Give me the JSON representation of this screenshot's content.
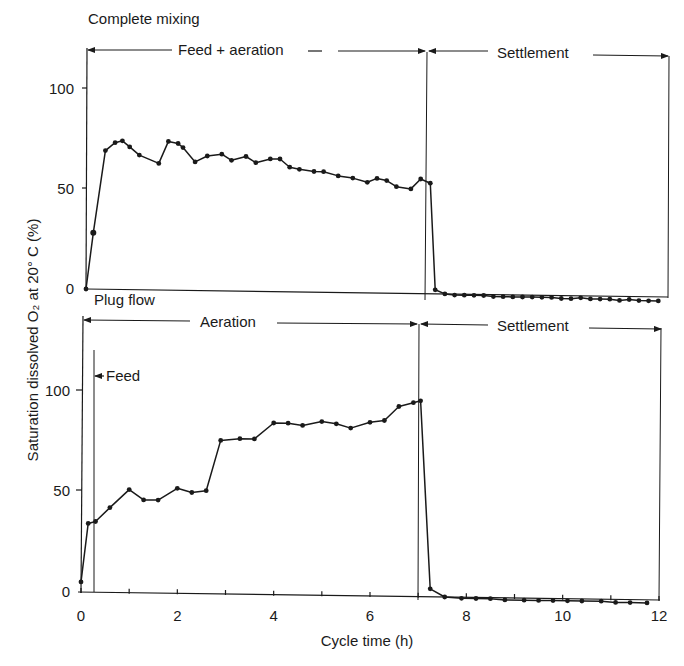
{
  "figure": {
    "y_axis_title": "Saturation dissolved O₂ at 20° C (%)",
    "x_axis_title": "Cycle time (h)",
    "x_ticks": [
      "0",
      "2",
      "4",
      "6",
      "8",
      "10",
      "12"
    ],
    "y_ticks": [
      "0",
      "50",
      "100"
    ]
  },
  "panels": [
    {
      "title": "Complete mixing",
      "phase_labels": [
        {
          "label": "Feed + aeration",
          "start_h": 0,
          "end_h": 7.1
        },
        {
          "label": "Settlement",
          "start_h": 7.1,
          "end_h": 12
        }
      ],
      "feed_marker": null
    },
    {
      "title": "Plug flow",
      "phase_labels": [
        {
          "label": "Aeration",
          "start_h": 0,
          "end_h": 7.0
        },
        {
          "label": "Settlement",
          "start_h": 7.0,
          "end_h": 12
        }
      ],
      "feed_marker": {
        "label": "Feed",
        "at_h": 0.25
      }
    }
  ],
  "chart_data": [
    {
      "type": "line",
      "title": "Complete mixing",
      "xlabel": "Cycle time (h)",
      "ylabel": "Saturation dissolved O2 at 20° C (%)",
      "xlim": [
        0,
        12
      ],
      "ylim": [
        0,
        100
      ],
      "grid": false,
      "annotations": [
        "Feed + aeration (0–7.1 h)",
        "Settlement (7.1–12 h)"
      ],
      "series": [
        {
          "name": "Complete mixing",
          "x": [
            0,
            0.15,
            0.4,
            0.6,
            0.75,
            0.9,
            1.1,
            1.5,
            1.7,
            1.9,
            2.0,
            2.25,
            2.5,
            2.8,
            3.0,
            3.3,
            3.5,
            3.8,
            4.0,
            4.2,
            4.4,
            4.7,
            4.9,
            5.2,
            5.5,
            5.8,
            6.0,
            6.2,
            6.4,
            6.7,
            6.9,
            7.1,
            7.2,
            7.4,
            7.6,
            7.8,
            8.0,
            8.2,
            8.4,
            8.6,
            8.8,
            9.0,
            9.2,
            9.4,
            9.6,
            9.8,
            10.0,
            10.2,
            10.4,
            10.6,
            10.8,
            11.0,
            11.2,
            11.4,
            11.6,
            11.8
          ],
          "values": [
            0,
            28,
            69,
            73,
            74,
            71,
            67,
            63,
            74,
            73,
            71,
            64,
            67,
            68,
            65,
            67,
            64,
            66,
            66,
            62,
            61,
            60,
            60,
            58,
            57,
            55,
            57,
            56,
            53,
            52,
            57,
            55,
            2,
            0,
            -0.5,
            -0.5,
            -0.5,
            -0.5,
            -1,
            -1,
            -1,
            -1,
            -1,
            -1,
            -1,
            -1.5,
            -1.5,
            -1,
            -1.5,
            -1.5,
            -1.5,
            -2,
            -1.5,
            -2,
            -2,
            -2
          ]
        }
      ]
    },
    {
      "type": "line",
      "title": "Plug flow",
      "xlabel": "Cycle time (h)",
      "ylabel": "Saturation dissolved O2 at 20° C (%)",
      "xlim": [
        0,
        12
      ],
      "ylim": [
        0,
        100
      ],
      "grid": false,
      "annotations": [
        "Aeration (0–7.0 h)",
        "Settlement (7.0–12 h)",
        "Feed (at ~0.25 h)"
      ],
      "series": [
        {
          "name": "Plug flow",
          "x": [
            0,
            0.15,
            0.3,
            0.6,
            1.0,
            1.3,
            1.6,
            2.0,
            2.3,
            2.6,
            2.9,
            3.3,
            3.6,
            4.0,
            4.3,
            4.6,
            5.0,
            5.3,
            5.6,
            6.0,
            6.3,
            6.6,
            6.9,
            7.05,
            7.25,
            7.55,
            7.9,
            8.2,
            8.5,
            8.8,
            9.2,
            9.5,
            9.8,
            10.1,
            10.4,
            10.8,
            11.1,
            11.4,
            11.75
          ],
          "values": [
            5,
            34,
            35,
            42,
            51,
            46,
            46,
            52,
            50,
            51,
            76,
            77,
            77,
            85,
            85,
            84,
            86,
            85,
            83,
            86,
            87,
            94,
            96,
            97,
            4,
            0,
            -0.5,
            -0.5,
            -0.5,
            -1,
            -1,
            -1,
            -1,
            -1,
            -1,
            -1,
            -1.5,
            -1.5,
            -1.5
          ]
        }
      ]
    }
  ]
}
